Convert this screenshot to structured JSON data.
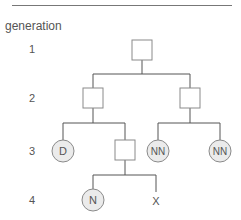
{
  "title": "generation",
  "generations": [
    {
      "label": "1"
    },
    {
      "label": "2"
    },
    {
      "label": "3"
    },
    {
      "label": "4"
    }
  ],
  "individuals": {
    "g1_parent": {
      "shape": "square",
      "label": ""
    },
    "g2_left": {
      "shape": "square",
      "label": ""
    },
    "g2_right": {
      "shape": "square",
      "label": ""
    },
    "g3_d": {
      "shape": "circle",
      "label": "D"
    },
    "g3_square": {
      "shape": "square",
      "label": ""
    },
    "g3_nn1": {
      "shape": "circle",
      "label": "NN"
    },
    "g3_nn2": {
      "shape": "circle",
      "label": "NN"
    },
    "g4_n": {
      "shape": "circle",
      "label": "N"
    },
    "g4_x": {
      "shape": "unknown",
      "label": "X"
    }
  },
  "colors": {
    "line": "#555555",
    "circle_fill": "#ebebeb",
    "square_stroke": "#8a8a8a"
  }
}
